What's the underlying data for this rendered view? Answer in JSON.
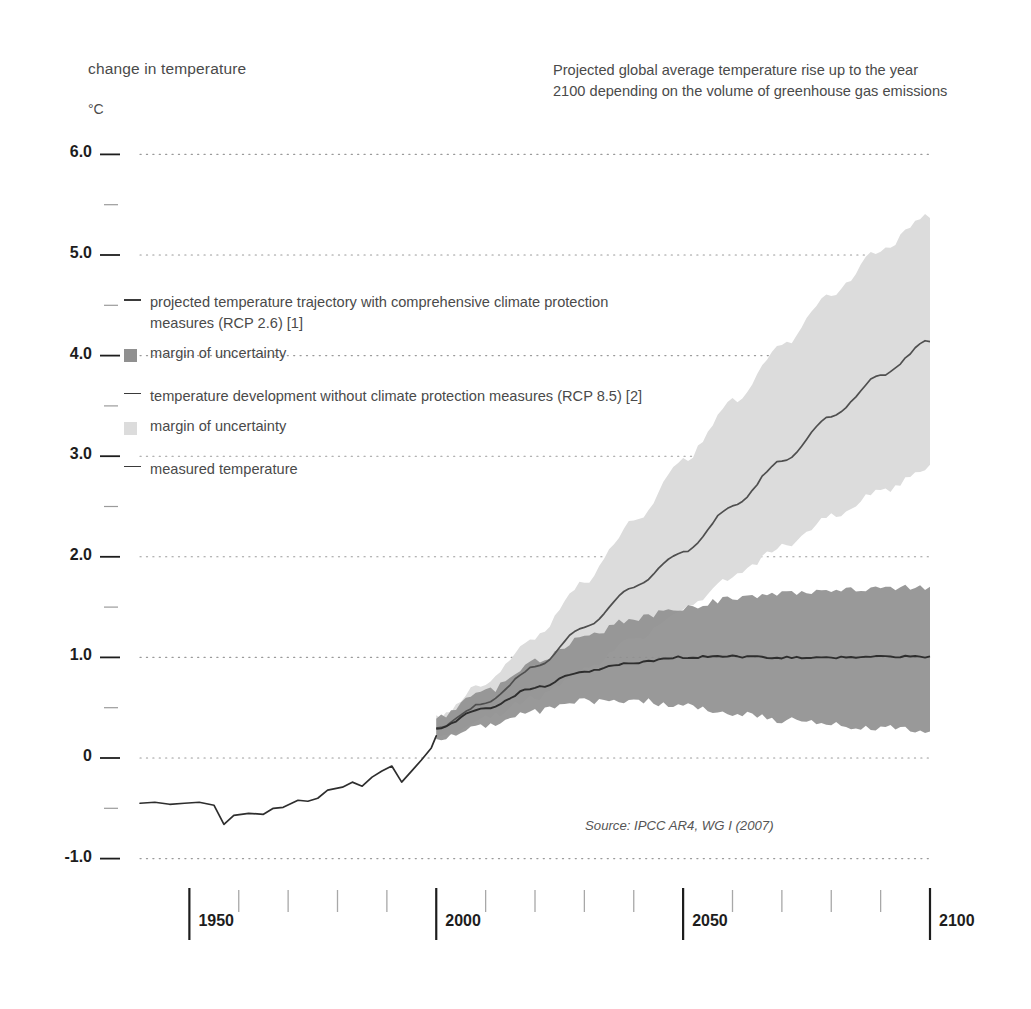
{
  "header": {
    "axis_title": "change in temperature",
    "unit": "°C",
    "title": "Projected global average temperature rise up to the year 2100 depending on the volume of greenhouse gas emissions"
  },
  "legend": {
    "items": [
      {
        "marker": "line-dark",
        "label": "projected temperature trajectory with comprehensive climate protection measures (RCP 2.6) [1]"
      },
      {
        "marker": "swatch-dark",
        "label": "margin of uncertainty"
      },
      {
        "marker": "line-dark",
        "label": "temperature development without climate protection measures (RCP 8.5) [2]"
      },
      {
        "marker": "swatch-light",
        "label": "margin of uncertainty"
      },
      {
        "marker": "line-dark",
        "label": "measured temperature"
      }
    ]
  },
  "source": "Source: IPCC AR4, WG I (2007)",
  "colors": {
    "band_rcp26": "#909090",
    "band_rcp85": "#dcdcdc",
    "line": "#2e2e2e",
    "gridline": "#9a9a9a",
    "axis": "#1d1d1d",
    "text": "#4a4a4a"
  },
  "chart_data": {
    "type": "area",
    "title": "Projected global average temperature rise up to the year 2100 depending on the volume of greenhouse gas emissions",
    "xlabel": "",
    "ylabel": "change in temperature",
    "yunit": "°C",
    "xlim": [
      1940,
      2100
    ],
    "ylim": [
      -1.0,
      6.0
    ],
    "grid": true,
    "legend_position": "inside-upper-left",
    "y_ticks_major": [
      "6.0",
      "5.0",
      "4.0",
      "3.0",
      "2.0",
      "1.0",
      "0",
      "-1.0"
    ],
    "y_ticks_major_values": [
      6.0,
      5.0,
      4.0,
      3.0,
      2.0,
      1.0,
      0.0,
      -1.0
    ],
    "y_ticks_minor_values": [
      5.5,
      4.5,
      3.5,
      2.5,
      1.5,
      0.5,
      -0.5
    ],
    "x_ticks_major": [
      "1950",
      "2000",
      "2050",
      "2100"
    ],
    "x_ticks_major_values": [
      1950,
      2000,
      2050,
      2100
    ],
    "x_ticks_minor_values": [
      1960,
      1970,
      1980,
      1990,
      2010,
      2020,
      2030,
      2040,
      2060,
      2070,
      2080,
      2090
    ],
    "series": [
      {
        "name": "measured temperature",
        "kind": "line",
        "x": [
          1940,
          1943,
          1946,
          1949,
          1952,
          1955,
          1957,
          1959,
          1962,
          1965,
          1967,
          1969,
          1972,
          1974,
          1976,
          1978,
          1981,
          1983,
          1985,
          1987,
          1989,
          1991,
          1993,
          1995,
          1997,
          1999,
          2000
        ],
        "values": [
          -0.45,
          -0.44,
          -0.46,
          -0.45,
          -0.44,
          -0.47,
          -0.66,
          -0.57,
          -0.55,
          -0.56,
          -0.5,
          -0.49,
          -0.42,
          -0.43,
          -0.4,
          -0.32,
          -0.29,
          -0.24,
          -0.28,
          -0.19,
          -0.13,
          -0.08,
          -0.24,
          -0.13,
          -0.02,
          0.1,
          0.22
        ]
      },
      {
        "name": "projected temperature trajectory with comprehensive climate protection measures (RCP 2.6) [1]",
        "kind": "line",
        "x": [
          2000,
          2010,
          2020,
          2030,
          2040,
          2050,
          2060,
          2070,
          2080,
          2090,
          2100
        ],
        "values": [
          0.3,
          0.5,
          0.7,
          0.86,
          0.95,
          1.0,
          1.01,
          1.0,
          1.0,
          1.01,
          1.0
        ]
      },
      {
        "name": "margin of uncertainty (RCP 2.6)",
        "kind": "band",
        "x": [
          2000,
          2010,
          2020,
          2030,
          2040,
          2050,
          2060,
          2070,
          2080,
          2090,
          2100
        ],
        "lower": [
          0.2,
          0.33,
          0.46,
          0.56,
          0.58,
          0.52,
          0.44,
          0.38,
          0.33,
          0.3,
          0.28
        ],
        "upper": [
          0.4,
          0.66,
          0.96,
          1.2,
          1.38,
          1.5,
          1.58,
          1.63,
          1.66,
          1.68,
          1.7
        ]
      },
      {
        "name": "temperature development without climate protection measures (RCP 8.5) [2]",
        "kind": "line",
        "x": [
          2000,
          2010,
          2020,
          2030,
          2040,
          2050,
          2060,
          2070,
          2080,
          2090,
          2100
        ],
        "values": [
          0.3,
          0.55,
          0.9,
          1.3,
          1.7,
          2.05,
          2.5,
          2.95,
          3.4,
          3.8,
          4.15
        ]
      },
      {
        "name": "margin of uncertainty (RCP 8.5)",
        "kind": "band",
        "x": [
          2000,
          2010,
          2020,
          2030,
          2040,
          2050,
          2060,
          2070,
          2080,
          2090,
          2100
        ],
        "lower": [
          0.2,
          0.4,
          0.6,
          0.88,
          1.18,
          1.48,
          1.8,
          2.1,
          2.4,
          2.65,
          2.9
        ],
        "upper": [
          0.4,
          0.75,
          1.2,
          1.75,
          2.35,
          2.95,
          3.55,
          4.1,
          4.6,
          5.05,
          5.4
        ]
      }
    ],
    "annotation": "Source: IPCC AR4, WG I (2007)"
  }
}
